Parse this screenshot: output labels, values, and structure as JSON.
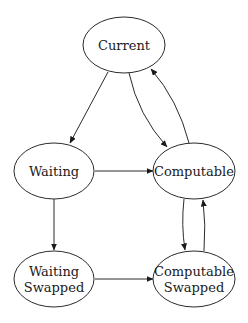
{
  "diagram": {
    "type": "state-transition",
    "nodes": [
      {
        "id": "current",
        "lines": [
          "Current"
        ],
        "cx": 124,
        "cy": 45
      },
      {
        "id": "waiting",
        "lines": [
          "Waiting"
        ],
        "cx": 54,
        "cy": 171
      },
      {
        "id": "computable",
        "lines": [
          "Computable"
        ],
        "cx": 194,
        "cy": 171
      },
      {
        "id": "waiting_swapped",
        "lines": [
          "Waiting",
          "Swapped"
        ],
        "cx": 54,
        "cy": 279
      },
      {
        "id": "computable_swapped",
        "lines": [
          "Computable",
          "Swapped"
        ],
        "cx": 194,
        "cy": 279
      }
    ],
    "edges": [
      {
        "from": "Current",
        "to": "Waiting"
      },
      {
        "from": "Current",
        "to": "Computable"
      },
      {
        "from": "Computable",
        "to": "Current"
      },
      {
        "from": "Waiting",
        "to": "Computable"
      },
      {
        "from": "Waiting",
        "to": "Waiting Swapped"
      },
      {
        "from": "Computable",
        "to": "Computable Swapped"
      },
      {
        "from": "Computable Swapped",
        "to": "Computable"
      },
      {
        "from": "Waiting Swapped",
        "to": "Computable Swapped"
      }
    ],
    "colors": {
      "stroke": "#2b2b2b",
      "fill": "#ffffff",
      "text": "#1a1a1a"
    }
  }
}
